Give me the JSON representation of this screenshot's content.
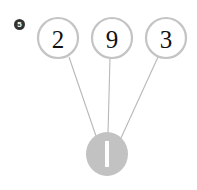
{
  "canvas": {
    "width": 197,
    "height": 190,
    "background": "#ffffff"
  },
  "question": {
    "badge_label": "5",
    "badge_color": "#333333",
    "badge_text_color": "#ffffff"
  },
  "diagram": {
    "type": "number-bond-tree",
    "edge_color": "#b8b8b8",
    "node_stroke_color": "#c4c4c4",
    "node_fill_color": "#ffffff",
    "node_text_color": "#111111",
    "target_fill_color": "#c2c2c2",
    "target_bar_color": "#ffffff",
    "nodes": [
      {
        "id": "node-1",
        "label": "2",
        "cx": 58,
        "cy": 38,
        "r": 20
      },
      {
        "id": "node-2",
        "label": "9",
        "cx": 112,
        "cy": 38,
        "r": 20
      },
      {
        "id": "node-3",
        "label": "3",
        "cx": 166,
        "cy": 38,
        "r": 20
      }
    ],
    "target": {
      "id": "target-node",
      "label": "1",
      "cx": 107,
      "cy": 154,
      "rx": 21,
      "ry": 22
    },
    "edges": [
      {
        "id": "edge-1",
        "from": "node-1",
        "to": "target-node",
        "x1": 69,
        "y1": 57,
        "x2": 96,
        "y2": 136
      },
      {
        "id": "edge-2",
        "from": "node-2",
        "to": "target-node",
        "x1": 110,
        "y1": 58,
        "x2": 108,
        "y2": 133
      },
      {
        "id": "edge-3",
        "from": "node-3",
        "to": "target-node",
        "x1": 158,
        "y1": 57,
        "x2": 121,
        "y2": 138
      }
    ]
  }
}
